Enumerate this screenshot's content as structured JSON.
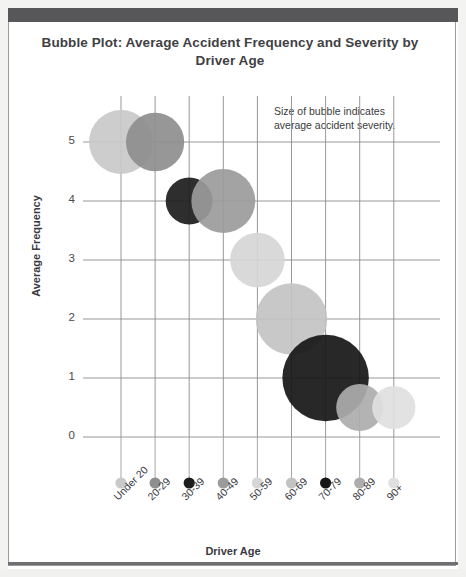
{
  "window": {
    "header_bar_color": "#57575a",
    "card_bg": "#ffffff",
    "card_border": "#9a9a9a"
  },
  "chart_data": {
    "type": "bubble",
    "title": "Bubble Plot: Average Accident Frequency and Severity by Driver Age",
    "title_line1": "Bubble Plot: Average Accident Frequency and Severity by",
    "title_line2": "Driver Age",
    "annotation_line1": "Size of bubble indicates",
    "annotation_line2": "average accident severity.",
    "xlabel": "Driver Age",
    "ylabel": "Average Frequency",
    "categories": [
      "Under 20",
      "20-29",
      "30-39",
      "40-49",
      "50-59",
      "60-69",
      "70-79",
      "80-89",
      "90+"
    ],
    "yticks": [
      "5",
      "4",
      "3",
      "2",
      "1",
      "0"
    ],
    "ylim": [
      0,
      5.5
    ],
    "grid": true,
    "legend": "none",
    "values": [
      5.0,
      5.0,
      4.0,
      4.0,
      3.0,
      2.0,
      1.0,
      0.5,
      0.5
    ],
    "sizes": [
      3.4,
      3.1,
      2.5,
      3.4,
      2.9,
      3.8,
      4.6,
      2.5,
      2.3
    ],
    "colors": [
      "#c9c9c9",
      "#8e8e8e",
      "#1c1c1c",
      "#9b9b9b",
      "#d6d6d6",
      "#c3c3c3",
      "#161616",
      "#adadad",
      "#e0e0e0"
    ],
    "points": [
      {
        "category": "Under 20",
        "frequency": 5.0,
        "severity": 3.4,
        "color": "#c9c9c9"
      },
      {
        "category": "20-29",
        "frequency": 5.0,
        "severity": 3.1,
        "color": "#8e8e8e"
      },
      {
        "category": "30-39",
        "frequency": 4.0,
        "severity": 2.5,
        "color": "#1c1c1c"
      },
      {
        "category": "40-49",
        "frequency": 4.0,
        "severity": 3.4,
        "color": "#9b9b9b"
      },
      {
        "category": "50-59",
        "frequency": 3.0,
        "severity": 2.9,
        "color": "#d6d6d6"
      },
      {
        "category": "60-69",
        "frequency": 2.0,
        "severity": 3.8,
        "color": "#c3c3c3"
      },
      {
        "category": "70-79",
        "frequency": 1.0,
        "severity": 4.6,
        "color": "#161616"
      },
      {
        "category": "80-89",
        "frequency": 0.5,
        "severity": 2.5,
        "color": "#adadad"
      },
      {
        "category": "90+",
        "frequency": 0.5,
        "severity": 2.3,
        "color": "#e0e0e0"
      }
    ]
  }
}
